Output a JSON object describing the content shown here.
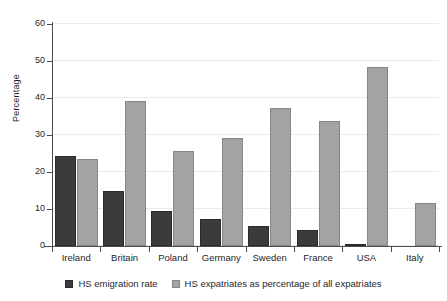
{
  "chart_data": {
    "type": "bar",
    "title": "",
    "xlabel": "",
    "ylabel": "Percentage",
    "ylim": [
      0,
      60
    ],
    "yticks": [
      0,
      10,
      20,
      30,
      40,
      50,
      60
    ],
    "grid": true,
    "legend_position": "bottom",
    "categories": [
      "Ireland",
      "Britain",
      "Poland",
      "Germany",
      "Sweden",
      "France",
      "USA",
      "Italy"
    ],
    "series": [
      {
        "name": "HS emigration rate",
        "color": "#3b3b3b",
        "values": [
          24.2,
          14.8,
          9.4,
          7.2,
          5.5,
          4.2,
          0.5,
          0
        ]
      },
      {
        "name": "HS expatriates as percentage of all expatriates",
        "color": "#a3a3a3",
        "values": [
          23.5,
          39.1,
          25.6,
          29.3,
          37.4,
          33.9,
          48.3,
          11.7
        ]
      }
    ]
  },
  "axis": {
    "y_title": "Percentage",
    "y_tick_labels": [
      "0",
      "10",
      "20",
      "30",
      "40",
      "50",
      "60"
    ]
  },
  "legend": {
    "items": [
      {
        "label": "HS emigration rate",
        "swatch": "dark"
      },
      {
        "label": "HS expatriates as percentage of all expatriates",
        "swatch": "light"
      }
    ]
  }
}
